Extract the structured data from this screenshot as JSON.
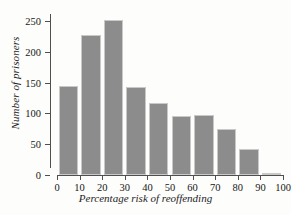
{
  "chart_data": {
    "type": "bar",
    "title": "",
    "xlabel": "Percentage risk of reoffending",
    "ylabel": "Number of prisoners",
    "categories": [
      "0-10",
      "10-20",
      "20-30",
      "30-40",
      "40-50",
      "50-60",
      "60-70",
      "70-80",
      "80-90",
      "90-100"
    ],
    "bin_edges": [
      0,
      10,
      20,
      30,
      40,
      50,
      60,
      70,
      80,
      90,
      100
    ],
    "values": [
      144,
      228,
      251,
      143,
      117,
      96,
      97,
      74,
      42,
      4
    ],
    "xlim": [
      0,
      100
    ],
    "ylim": [
      0,
      250
    ],
    "xticks": [
      0,
      10,
      20,
      30,
      40,
      50,
      60,
      70,
      80,
      90,
      100
    ],
    "yticks": [
      0,
      50,
      100,
      150,
      200,
      250
    ],
    "xtick_labels": [
      "0",
      "10",
      "20",
      "30",
      "40",
      "50",
      "60",
      "70",
      "80",
      "90",
      "100"
    ],
    "ytick_labels": [
      "0",
      "50",
      "100",
      "150",
      "200",
      "250"
    ],
    "grid": false,
    "legend": null,
    "bar_color": "#8c8c8c",
    "bar_edge_color": "#c9c9c9",
    "axis_color": "#4f4f4f",
    "background_color": "#fdfdfc"
  }
}
